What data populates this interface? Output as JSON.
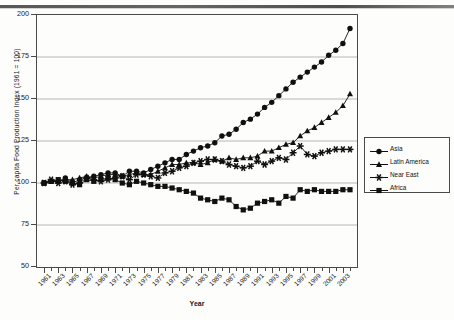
{
  "chart_data": {
    "type": "line",
    "title": "",
    "xlabel": "Year",
    "ylabel": "Per capita Food Production Index (1961 = 100)",
    "ylim": [
      50,
      200
    ],
    "yticks": [
      50,
      75,
      100,
      125,
      150,
      175,
      200
    ],
    "grid": true,
    "legend_position": "right-outside",
    "xlim": [
      1961,
      2004
    ],
    "x": [
      1961,
      1962,
      1963,
      1964,
      1965,
      1966,
      1967,
      1968,
      1969,
      1970,
      1971,
      1972,
      1973,
      1974,
      1975,
      1976,
      1977,
      1978,
      1979,
      1980,
      1981,
      1982,
      1983,
      1984,
      1985,
      1986,
      1987,
      1988,
      1989,
      1990,
      1991,
      1992,
      1993,
      1994,
      1995,
      1996,
      1997,
      1998,
      1999,
      2000,
      2001,
      2002,
      2003,
      2004
    ],
    "xtick_labels": [
      "1961",
      "1963",
      "1965",
      "1967",
      "1969",
      "1971",
      "1973",
      "1975",
      "1977",
      "1979",
      "1981",
      "1983",
      "1985",
      "1987",
      "1989",
      "1991",
      "1993",
      "1995",
      "1997",
      "1999",
      "2001",
      "2003"
    ],
    "series": [
      {
        "name": "Asia",
        "marker": "circle",
        "color": "#101010",
        "values": [
          100,
          101,
          101,
          103,
          100,
          102,
          103,
          104,
          105,
          106,
          106,
          104,
          107,
          107,
          106,
          108,
          110,
          112,
          114,
          114,
          117,
          119,
          121,
          122,
          124,
          128,
          129,
          132,
          136,
          138,
          141,
          145,
          148,
          152,
          156,
          160,
          163,
          166,
          169,
          172,
          176,
          179,
          183,
          192
        ]
      },
      {
        "name": "Latin America",
        "marker": "triangle",
        "color": "#101010",
        "values": [
          100,
          101,
          101,
          102,
          102,
          103,
          104,
          103,
          104,
          105,
          105,
          104,
          105,
          106,
          105,
          105,
          107,
          109,
          111,
          111,
          112,
          112,
          111,
          112,
          114,
          113,
          115,
          114,
          115,
          115,
          116,
          119,
          119,
          121,
          123,
          124,
          128,
          131,
          133,
          136,
          139,
          142,
          146,
          153
        ]
      },
      {
        "name": "Near East",
        "marker": "star",
        "color": "#101010",
        "values": [
          100,
          102,
          100,
          101,
          99,
          100,
          103,
          102,
          101,
          102,
          103,
          104,
          102,
          105,
          105,
          104,
          103,
          106,
          107,
          109,
          110,
          112,
          113,
          114,
          114,
          113,
          111,
          110,
          109,
          110,
          113,
          111,
          113,
          115,
          114,
          118,
          122,
          117,
          116,
          118,
          119,
          120,
          120,
          120
        ]
      },
      {
        "name": "Africa",
        "marker": "square",
        "color": "#101010",
        "values": [
          100,
          101,
          102,
          101,
          100,
          99,
          102,
          101,
          102,
          103,
          102,
          100,
          99,
          101,
          100,
          99,
          98,
          98,
          97,
          96,
          95,
          94,
          91,
          90,
          89,
          91,
          90,
          86,
          84,
          85,
          88,
          89,
          90,
          88,
          92,
          91,
          96,
          95,
          96,
          95,
          95,
          95,
          96,
          96
        ]
      }
    ]
  },
  "legend": {
    "items": [
      {
        "label": "Asia",
        "marker": "circle"
      },
      {
        "label": "Latin America",
        "marker": "triangle"
      },
      {
        "label": "Near East",
        "marker": "star"
      },
      {
        "label": "Africa",
        "marker": "square"
      }
    ]
  }
}
